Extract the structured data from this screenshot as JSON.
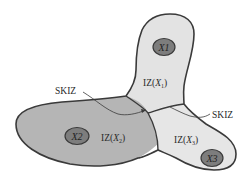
{
  "diagram": {
    "type": "influence-zones",
    "regions": [
      {
        "id": "iz1",
        "label_prefix": "IZ(",
        "var": "X",
        "sub": "1",
        "label_suffix": ")",
        "fill": "#e3e3e3"
      },
      {
        "id": "iz2",
        "label_prefix": "IZ(",
        "var": "X",
        "sub": "2",
        "label_suffix": ")",
        "fill": "#b5b5b5"
      },
      {
        "id": "iz3",
        "label_prefix": "IZ(",
        "var": "X",
        "sub": "3",
        "label_suffix": ")",
        "fill": "#e6e6e6"
      }
    ],
    "markers": [
      {
        "id": "x1",
        "label": "X1",
        "fill": "#7d7d7d"
      },
      {
        "id": "x2",
        "label": "X2",
        "fill": "#7d7d7d"
      },
      {
        "id": "x3",
        "label": "X3",
        "fill": "#7d7d7d"
      }
    ],
    "annotations": [
      {
        "id": "skiz-left",
        "text": "SKIZ"
      },
      {
        "id": "skiz-right",
        "text": "SKIZ"
      }
    ],
    "colors": {
      "outline": "#3a3a3a",
      "text": "#2a2a2a",
      "background": "#ffffff"
    }
  }
}
